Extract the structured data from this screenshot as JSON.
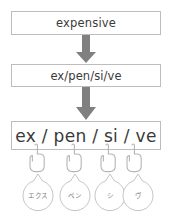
{
  "diagram": {
    "title_flow": "word syllable segmentation to katakana pronunciation",
    "steps": [
      {
        "id": "word",
        "text": "expensive"
      },
      {
        "id": "split",
        "text": "ex/pen/si/ve"
      },
      {
        "id": "final",
        "text": "ex / pen / si / ve"
      }
    ],
    "arrows": [
      {
        "name": "arrow-down-1",
        "direction": "down"
      },
      {
        "name": "arrow-down-2",
        "direction": "down"
      }
    ],
    "hands": [
      {
        "name": "pointing-hand-icon-1"
      },
      {
        "name": "pointing-hand-icon-2"
      },
      {
        "name": "pointing-hand-icon-3"
      },
      {
        "name": "pointing-hand-icon-4"
      }
    ],
    "bubbles": [
      {
        "label": "エクス"
      },
      {
        "label": "ペン"
      },
      {
        "label": "シ"
      },
      {
        "label": "ヴ"
      }
    ]
  },
  "colors": {
    "box_border": "#bdbdbd",
    "text": "#3a3a3a",
    "arrow": "#808080",
    "outline": "#b5b5b5",
    "bubble_text": "#7d7d7d",
    "background": "#ffffff"
  }
}
